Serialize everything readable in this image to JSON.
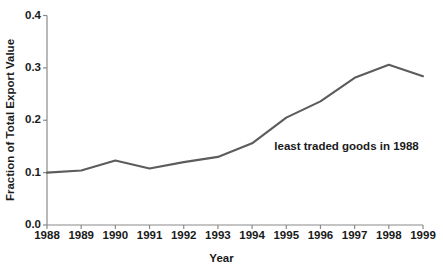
{
  "chart_data": {
    "type": "line",
    "title": "",
    "xlabel": "Year",
    "ylabel": "Fraction of Total Export Value",
    "x": [
      1988,
      1989,
      1990,
      1991,
      1992,
      1993,
      1994,
      1995,
      1996,
      1997,
      1998,
      1999
    ],
    "xtick_labels": [
      "1988",
      "1989",
      "1990",
      "1991",
      "1992",
      "1993",
      "1994",
      "1995",
      "1996",
      "1997",
      "1998",
      "1999"
    ],
    "ytick_labels": [
      "0.0",
      "0.1",
      "0.2",
      "0.3",
      "0.4"
    ],
    "ytick_values": [
      0.0,
      0.1,
      0.2,
      0.3,
      0.4
    ],
    "xlim": [
      1988,
      1999
    ],
    "ylim": [
      0.0,
      0.4
    ],
    "grid": false,
    "legend": null,
    "series": [
      {
        "name": "least traded goods in 1988",
        "color": "#5c5c5c",
        "values": [
          0.1,
          0.104,
          0.123,
          0.108,
          0.12,
          0.13,
          0.156,
          0.205,
          0.236,
          0.281,
          0.306,
          0.284
        ]
      }
    ],
    "annotations": [
      {
        "text": "least traded goods in 1988",
        "x": 1994.65,
        "y": 0.148
      }
    ]
  },
  "style": {
    "line_color": "#5c5c5c",
    "axis_color": "#8a8a8a",
    "text_color": "#1a1a1a",
    "background": "#ffffff"
  }
}
